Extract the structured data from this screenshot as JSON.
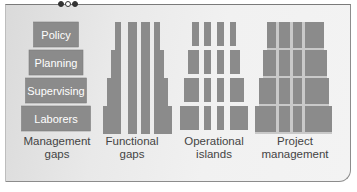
{
  "colors": {
    "block_fill": "#8b8b8b",
    "block_border": "#7d7d7d",
    "seam": "#c9c9c9",
    "label_text": "#ffffff",
    "caption_text": "#444444"
  },
  "decoration": {
    "dots": [
      "filled",
      "hollow",
      "filled"
    ]
  },
  "management_gaps": {
    "levels": [
      "Policy",
      "Planning",
      "Supervising",
      "Laborers"
    ],
    "caption": "Management\ngaps"
  },
  "functional_gaps": {
    "columns": 4,
    "tiers": 4,
    "caption": "Functional\ngaps"
  },
  "operational_islands": {
    "columns": 4,
    "tiers": 4,
    "caption": "Operational\nislands"
  },
  "project_management": {
    "columns": 4,
    "tiers": 4,
    "caption": "Project\nmanagement"
  }
}
